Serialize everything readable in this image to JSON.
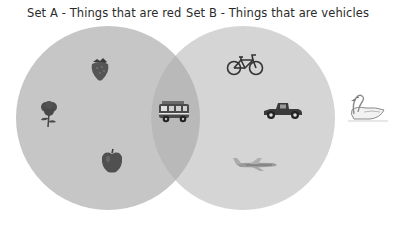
{
  "diagram": {
    "type": "venn",
    "sets": [
      {
        "id": "A",
        "label": "Set A - Things that are red",
        "fill": "#c6c6c6",
        "items": [
          "strawberry",
          "rose",
          "apple"
        ]
      },
      {
        "id": "B",
        "label": "Set B - Things that are vehicles",
        "fill": "#d5d5d5",
        "items": [
          "bicycle",
          "car",
          "airplane"
        ]
      }
    ],
    "intersection": {
      "fill": "#b9b9b9",
      "items": [
        "fire-truck"
      ]
    },
    "outside": {
      "items": [
        "swan"
      ]
    }
  },
  "icons": {
    "strawberry": "strawberry-icon",
    "rose": "rose-icon",
    "apple": "apple-icon",
    "fire_truck": "fire-truck-icon",
    "bicycle": "bicycle-icon",
    "car": "car-icon",
    "airplane": "airplane-icon",
    "swan": "swan-icon"
  }
}
